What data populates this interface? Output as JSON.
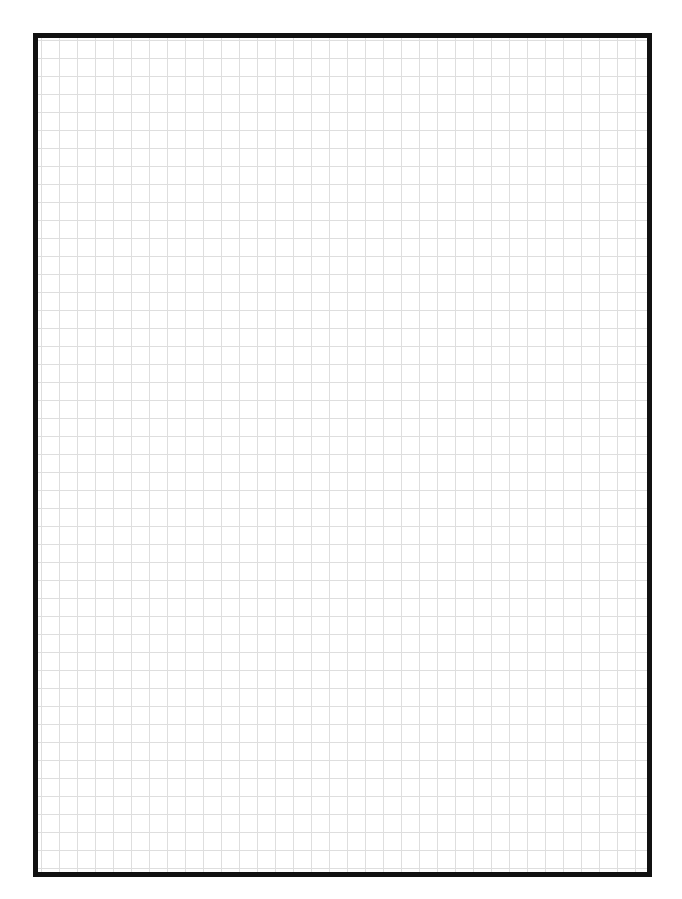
{
  "page": {
    "type": "graph-paper",
    "top_text_cutoff": ""
  },
  "grid": {
    "cell_size_px": 18,
    "columns": 34,
    "rows": 46,
    "line_color": "#dedede",
    "background_color": "#ffffff"
  },
  "border": {
    "color": "#111111",
    "thickness_px": 5
  }
}
